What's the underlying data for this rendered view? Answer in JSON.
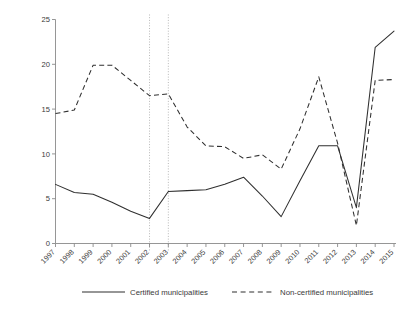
{
  "chart_data": {
    "type": "line",
    "title": "",
    "xlabel": "",
    "ylabel": "Per-capita education quality expenditure\nin thousand Colombian pesos",
    "categories": [
      "1997",
      "1998",
      "1999",
      "2000",
      "2001",
      "2002",
      "2003",
      "2004",
      "2005",
      "2006",
      "2007",
      "2008",
      "2009",
      "2010",
      "2011",
      "2012",
      "2013",
      "2014",
      "2015"
    ],
    "xlim": [
      1997,
      2015
    ],
    "ylim": [
      0,
      25
    ],
    "yticks": [
      0,
      5,
      10,
      15,
      20,
      25
    ],
    "ytick_labels": [
      "0",
      "5",
      "10",
      "15",
      "20",
      "25"
    ],
    "grid": false,
    "legend_position": "bottom",
    "annotations": [
      {
        "type": "vline",
        "x": "2002",
        "style": "dotted"
      },
      {
        "type": "vline",
        "x": "2003",
        "style": "dotted"
      }
    ],
    "series": [
      {
        "name": "Certified municipalities",
        "style": "solid",
        "values": [
          6.6,
          5.7,
          5.5,
          4.6,
          3.6,
          2.8,
          5.8,
          5.9,
          6.0,
          6.6,
          7.4,
          5.3,
          3.0,
          7.0,
          10.9,
          10.9,
          4.0,
          21.9,
          23.7
        ]
      },
      {
        "name": "Non-certified municipalities",
        "style": "dashed",
        "values": [
          14.5,
          14.9,
          19.9,
          19.9,
          18.2,
          16.5,
          16.7,
          13.0,
          10.9,
          10.8,
          9.5,
          9.9,
          8.3,
          12.8,
          18.6,
          11.2,
          2.0,
          18.2,
          18.3
        ]
      }
    ]
  },
  "legend": {
    "items": [
      {
        "label": "Certified municipalities",
        "style": "solid"
      },
      {
        "label": "Non-certified municipalities",
        "style": "dashed"
      }
    ]
  }
}
